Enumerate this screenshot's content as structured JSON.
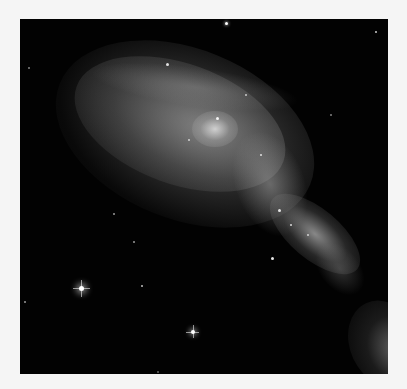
{
  "image": {
    "subject": "spiral galaxy (grayscale astronomical photograph)",
    "palette": {
      "border": "#f5f5f5",
      "sky": "#020202",
      "glow": "#9a9a9a",
      "highlight": "#ffffff"
    },
    "bright_stars": [
      {
        "x": 61,
        "y": 269,
        "size": 5,
        "spikes": true
      },
      {
        "x": 173,
        "y": 313,
        "size": 4,
        "spikes": true
      },
      {
        "x": 206,
        "y": 4,
        "size": 3,
        "spikes": false
      },
      {
        "x": 356,
        "y": 13,
        "size": 2,
        "spikes": false
      },
      {
        "x": 111,
        "y": 249,
        "size": 2,
        "spikes": false
      },
      {
        "x": 252,
        "y": 239,
        "size": 3,
        "spikes": false
      },
      {
        "x": 4,
        "y": 283,
        "size": 2,
        "spikes": false
      },
      {
        "x": 93,
        "y": 194,
        "size": 2,
        "spikes": false
      },
      {
        "x": 113,
        "y": 222,
        "size": 2,
        "spikes": false
      }
    ]
  }
}
